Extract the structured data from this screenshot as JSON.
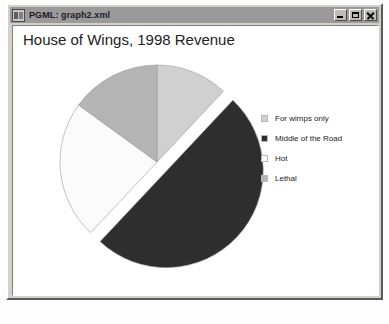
{
  "window": {
    "title": "PGML: graph2.xml",
    "icon": "document-icon",
    "buttons": {
      "minimize": "minimize-icon",
      "maximize": "maximize-icon",
      "close": "close-icon"
    }
  },
  "chart_data": {
    "type": "pie",
    "title": "House of Wings, 1998 Revenue",
    "xlabel": "",
    "ylabel": "",
    "legend_position": "right",
    "grid": false,
    "categories": [
      "For wimps only",
      "Middle of the Road",
      "Hot",
      "Lethal"
    ],
    "values": [
      12,
      50,
      23,
      15
    ],
    "colors": [
      "#d0d0d0",
      "#2e2e2e",
      "#fbfbfb",
      "#b4b4b4"
    ],
    "start_angle": -90,
    "exploded": [
      "Middle of the Road"
    ],
    "slices": [
      {
        "label": "For wimps only",
        "value": 12,
        "color": "#d0d0d0",
        "exploded": false
      },
      {
        "label": "Middle of the Road",
        "value": 50,
        "color": "#2e2e2e",
        "exploded": true
      },
      {
        "label": "Hot",
        "value": 23,
        "color": "#fbfbfb",
        "exploded": false
      },
      {
        "label": "Lethal",
        "value": 15,
        "color": "#b4b4b4",
        "exploded": false
      }
    ]
  }
}
